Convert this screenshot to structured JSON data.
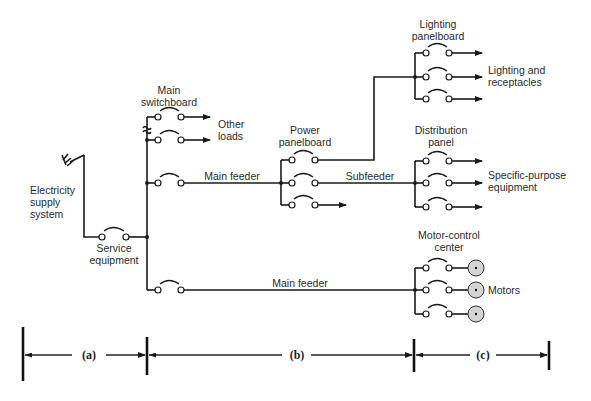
{
  "diagram": {
    "labels": {
      "electricity_supply": [
        "Electricity",
        "supply",
        "system"
      ],
      "service_equipment": [
        "Service",
        "equipment"
      ],
      "main_switchboard": [
        "Main",
        "switchboard"
      ],
      "other_loads": [
        "Other",
        "loads"
      ],
      "main_feeder_upper": "Main feeder",
      "main_feeder_lower": "Main feeder",
      "power_panelboard": [
        "Power",
        "panelboard"
      ],
      "subfeeder": "Subfeeder",
      "lighting_panelboard": [
        "Lighting",
        "panelboard"
      ],
      "lighting_receptacles": [
        "Lighting and",
        "receptacles"
      ],
      "distribution_panel": [
        "Distribution",
        "panel"
      ],
      "specific_purpose": [
        "Specific-purpose",
        "equipment"
      ],
      "motor_control_center": [
        "Motor-control",
        "center"
      ],
      "motors": "Motors"
    },
    "sections": [
      {
        "label": "(a)"
      },
      {
        "label": "(b)"
      },
      {
        "label": "(c)"
      }
    ],
    "icons": {
      "supply": "power-plug-icon",
      "switch": "circuit-breaker-icon",
      "motor": "motor-icon"
    },
    "colors": {
      "line": "#1a1a1a",
      "motor_fill": "#d4d4d4"
    }
  }
}
